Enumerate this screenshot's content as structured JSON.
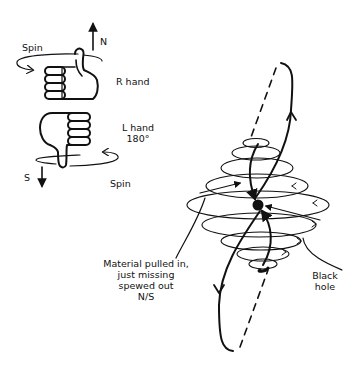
{
  "diagram": {
    "type": "black-hole-jet-illustration",
    "left_panel": {
      "labels": {
        "north": "N",
        "south": "S",
        "spin_top": "Spin",
        "spin_bottom": "Spin",
        "right_hand": "R hand",
        "left_hand_line1": "L hand",
        "left_hand_line2": "180°"
      },
      "icons": [
        "right-hand-thumb-up-icon",
        "left-hand-thumb-down-icon",
        "north-arrow-icon",
        "south-arrow-icon",
        "spin-arrow-icon"
      ]
    },
    "right_panel": {
      "labels": {
        "material_line1": "Material pulled in,",
        "material_line2": "just missing",
        "material_line3": "spewed out",
        "material_line4": "N/S",
        "black_hole_line1": "Black",
        "black_hole_line2": "hole"
      },
      "accretion_disk_rings": 8,
      "jets": [
        "north-loop",
        "south-loop"
      ]
    },
    "colors": {
      "ink": "#111111",
      "background": "#ffffff"
    }
  }
}
